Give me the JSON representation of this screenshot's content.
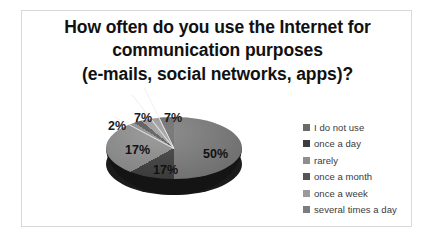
{
  "chart_data": {
    "type": "pie",
    "title": "How often do you use the Internet for communication purposes (e-mails, social networks, apps)?",
    "title_lines": [
      "How often do you use the Internet for",
      "communication purposes",
      "(e-mails, social networks, apps)?"
    ],
    "categories": [
      "I do not use",
      "once a day",
      "rarely",
      "once a month",
      "once a week",
      "several times a day"
    ],
    "values": [
      7,
      17,
      17,
      2,
      7,
      50
    ],
    "value_labels": [
      "7%",
      "17%",
      "17%",
      "2%",
      "7%",
      "50%"
    ],
    "colors": [
      "#6a6a6a",
      "#3c3c3c",
      "#8e8e8e",
      "#555555",
      "#9a9a9a",
      "#7c7c7c"
    ],
    "units": "percent",
    "legend_position": "right",
    "three_d": true,
    "xlabel": "",
    "ylabel": ""
  },
  "legend": {
    "items": [
      {
        "label": "I do not use",
        "color": "#6a6a6a"
      },
      {
        "label": "once a day",
        "color": "#3c3c3c"
      },
      {
        "label": "rarely",
        "color": "#8e8e8e"
      },
      {
        "label": "once a month",
        "color": "#555555"
      },
      {
        "label": "once a week",
        "color": "#9a9a9a"
      },
      {
        "label": "several times a day",
        "color": "#7c7c7c"
      }
    ]
  },
  "labels": {
    "slice_50": "50%",
    "slice_17_a": "17%",
    "slice_17_b": "17%",
    "slice_2": "2%",
    "slice_7_a": "7%",
    "slice_7_b": "7%"
  }
}
